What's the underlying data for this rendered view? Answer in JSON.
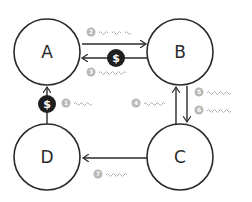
{
  "diagram": {
    "type": "flow",
    "colors": {
      "stroke": "#2a2a2a",
      "badge": "#b8b8b8",
      "squiggle": "#b0b0b0",
      "coin": "#1e1e1e",
      "coin_text": "#ffffff"
    },
    "nodes": [
      {
        "id": "A",
        "label": "A"
      },
      {
        "id": "B",
        "label": "B"
      },
      {
        "id": "C",
        "label": "C"
      },
      {
        "id": "D",
        "label": "D"
      }
    ],
    "edges": [
      {
        "from": "D",
        "to": "A",
        "step": "1",
        "has_coin": true
      },
      {
        "from": "A",
        "to": "B",
        "step": "2",
        "has_coin": false
      },
      {
        "from": "B",
        "to": "A",
        "step": "3",
        "has_coin": true
      },
      {
        "from": "C",
        "to": "B",
        "step": "4",
        "has_coin": false
      },
      {
        "from": "B",
        "to": "C",
        "step": "5",
        "has_coin": false
      },
      {
        "from": "B",
        "to": "C",
        "step": "6",
        "has_coin": false
      },
      {
        "from": "C",
        "to": "D",
        "step": "7",
        "has_coin": false
      }
    ],
    "steps": [
      "1",
      "2",
      "3",
      "4",
      "5",
      "6",
      "7"
    ],
    "coin_symbol": "$"
  }
}
